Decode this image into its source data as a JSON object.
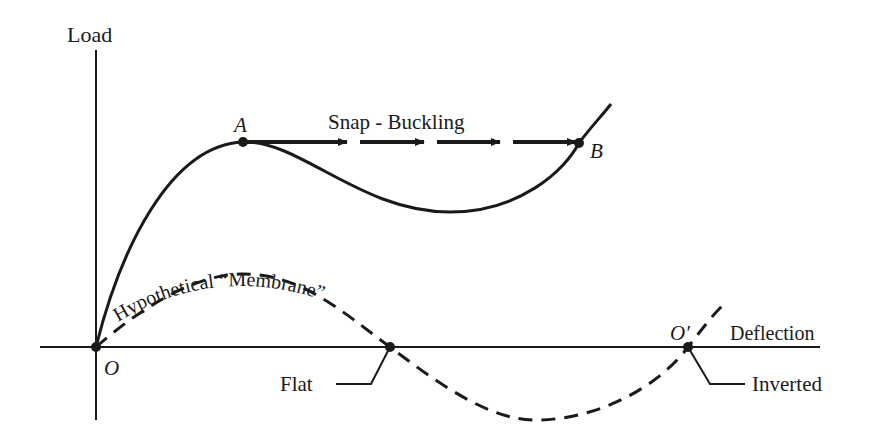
{
  "diagram": {
    "axes": {
      "y_label": "Load",
      "x_label": "Deflection"
    },
    "points": {
      "origin": "O",
      "a": "A",
      "b": "B",
      "o_prime": "O′"
    },
    "labels": {
      "snap_buckling": "Snap - Buckling",
      "membrane": "Hypothetical “Membrane”",
      "flat": "Flat",
      "inverted": "Inverted"
    },
    "colors": {
      "ink": "#1a1a1a",
      "background": "#ffffff"
    }
  }
}
